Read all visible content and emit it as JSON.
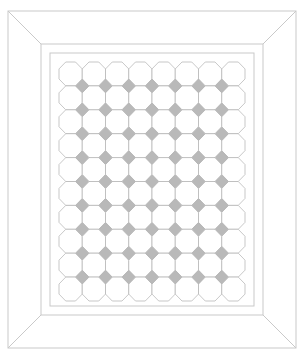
{
  "canvas": {
    "width": 303,
    "height": 358,
    "background": "#ffffff"
  },
  "frame": {
    "name": "picture-frame",
    "style": "mitered",
    "outer": {
      "x": 8,
      "y": 11,
      "width": 288,
      "height": 337
    },
    "middle": {
      "x": 41,
      "y": 44,
      "width": 222,
      "height": 271
    },
    "inner": {
      "x": 50,
      "y": 53,
      "width": 204,
      "height": 253
    },
    "stroke_color": "#c9c9c9",
    "stroke_width": 1,
    "fill_color": "#ffffff",
    "miter_lines": 4,
    "bevel_labels": [
      "top-rail",
      "right-rail",
      "bottom-rail",
      "left-rail"
    ]
  },
  "tile_field": {
    "name": "tile-field",
    "x": 59,
    "y": 62,
    "width": 186,
    "height": 239,
    "columns": 8,
    "rows": 10,
    "cell_width": 23.25,
    "cell_height": 23.9,
    "background": "#ffffff",
    "octagon": {
      "fill": "#ffffff",
      "stroke": "#b0b0b0",
      "stroke_width": 0.7,
      "corner_cut_ratio": 0.29,
      "count": 80
    },
    "diamond": {
      "fill": "#b9b9b9",
      "stroke": "#aaaaaa",
      "stroke_width": 0.4,
      "half_width": 6.6,
      "half_height": 6.8,
      "count": 63
    }
  },
  "legend": {
    "octagon_label": "octagon tile",
    "diamond_label": "diamond insert",
    "frame_label": "frame"
  }
}
